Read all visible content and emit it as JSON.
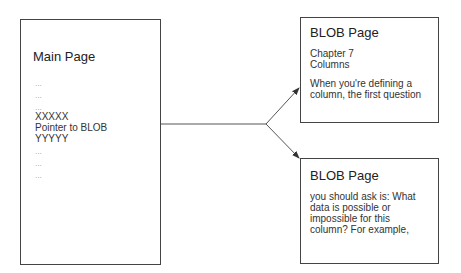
{
  "main_page": {
    "title": "Main Page",
    "lines": [
      "...",
      "...",
      "...",
      "XXXXX",
      "Pointer to BLOB",
      "YYYYY",
      "...",
      "...",
      "..."
    ]
  },
  "blob_page_1": {
    "title": "BLOB Page",
    "lines_a": [
      "Chapter 7",
      "Columns"
    ],
    "lines_b": [
      "When you're defining a",
      "column, the first question"
    ]
  },
  "blob_page_2": {
    "title": "BLOB Page",
    "lines": [
      "you should ask is: What",
      "data is possible or",
      "impossible for this",
      "column? For example,"
    ]
  }
}
